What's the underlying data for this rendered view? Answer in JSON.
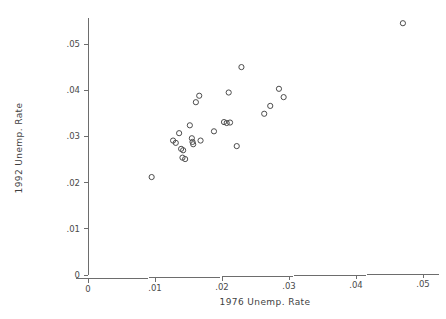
{
  "chart_data": {
    "type": "scatter",
    "title": "",
    "xlabel": "1976 Unemp. Rate",
    "ylabel": "1992 Unemp. Rate",
    "xlim": [
      0,
      0.0534
    ],
    "ylim": [
      0,
      0.0596
    ],
    "xticks": [
      0,
      0.01,
      0.02,
      0.03,
      0.04,
      0.05
    ],
    "yticks": [
      0,
      0.01,
      0.02,
      0.03,
      0.04,
      0.05
    ],
    "xticklabels": [
      "0",
      ".01",
      ".02",
      ".03",
      ".04",
      ".05"
    ],
    "yticklabels": [
      "0",
      ".01",
      ".02",
      ".03",
      ".04",
      ".05"
    ],
    "grid": false,
    "legend": false,
    "marker": "open-circle",
    "marker_color": "#4c4c4c",
    "points": [
      {
        "x": 0.0095,
        "y": 0.0212
      },
      {
        "x": 0.0127,
        "y": 0.0291
      },
      {
        "x": 0.0131,
        "y": 0.0286
      },
      {
        "x": 0.0136,
        "y": 0.0307
      },
      {
        "x": 0.0139,
        "y": 0.0273
      },
      {
        "x": 0.0142,
        "y": 0.027
      },
      {
        "x": 0.0141,
        "y": 0.0254
      },
      {
        "x": 0.0145,
        "y": 0.0251
      },
      {
        "x": 0.0152,
        "y": 0.0324
      },
      {
        "x": 0.0155,
        "y": 0.0296
      },
      {
        "x": 0.0156,
        "y": 0.0288
      },
      {
        "x": 0.0157,
        "y": 0.0283
      },
      {
        "x": 0.0161,
        "y": 0.0374
      },
      {
        "x": 0.0166,
        "y": 0.0388
      },
      {
        "x": 0.0168,
        "y": 0.0291
      },
      {
        "x": 0.0188,
        "y": 0.0311
      },
      {
        "x": 0.0203,
        "y": 0.0331
      },
      {
        "x": 0.0207,
        "y": 0.0329
      },
      {
        "x": 0.021,
        "y": 0.0395
      },
      {
        "x": 0.0212,
        "y": 0.033
      },
      {
        "x": 0.0222,
        "y": 0.0279
      },
      {
        "x": 0.0229,
        "y": 0.045
      },
      {
        "x": 0.0263,
        "y": 0.0349
      },
      {
        "x": 0.0272,
        "y": 0.0366
      },
      {
        "x": 0.0285,
        "y": 0.0403
      },
      {
        "x": 0.0292,
        "y": 0.0385
      },
      {
        "x": 0.047,
        "y": 0.0545
      }
    ]
  },
  "geometry": {
    "origin_x_px": 88,
    "origin_y_px": 275,
    "x_scale_px_per_unit": 6700,
    "y_scale_px_per_unit": 4620,
    "axis_top_px": 18,
    "axis_right_px": 440,
    "tick_len_px": 4,
    "marker_radius_px": 2.6
  }
}
